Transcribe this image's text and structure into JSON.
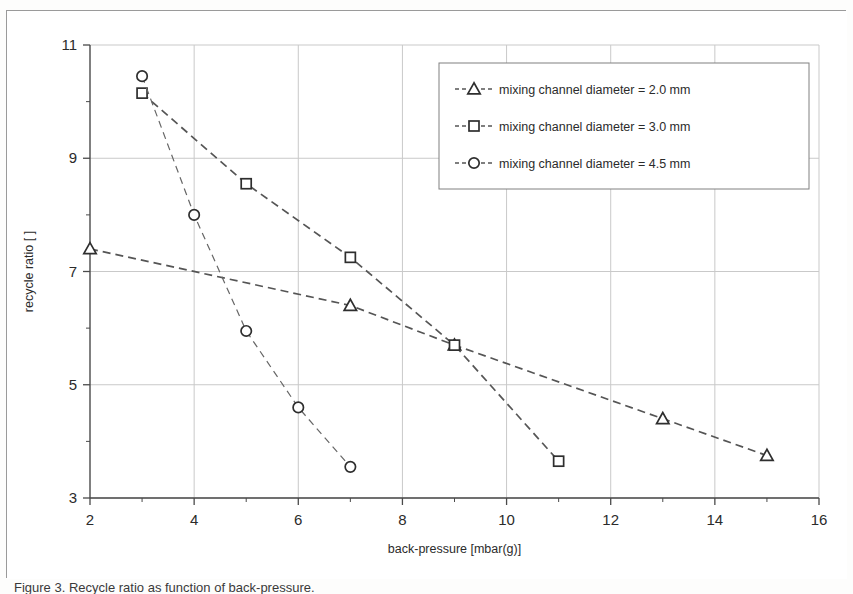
{
  "figure": {
    "caption": "Figure 3. Recycle ratio as function of back-pressure."
  },
  "chart_data": {
    "type": "line",
    "title": "",
    "xlabel": "back-pressure [mbar(g)]",
    "ylabel": "recycle ratio [ ]",
    "xlim": [
      2,
      16
    ],
    "ylim": [
      3,
      11
    ],
    "xticks": [
      2,
      4,
      6,
      8,
      10,
      12,
      14,
      16
    ],
    "yticks": [
      3,
      5,
      7,
      9,
      11
    ],
    "xtick_labels": [
      "2",
      "4",
      "6",
      "8",
      "10",
      "12",
      "14",
      "16"
    ],
    "ytick_labels": [
      "3",
      "5",
      "7",
      "9",
      "11"
    ],
    "x_minor_step": 1,
    "y_minor_step": 1,
    "grid": true,
    "legend_position": "top-right",
    "series": [
      {
        "name": "mixing channel diameter = 2.0 mm",
        "marker": "triangle",
        "x": [
          2,
          7,
          9,
          13,
          15
        ],
        "y": [
          7.4,
          6.4,
          5.7,
          4.4,
          3.75
        ]
      },
      {
        "name": "mixing channel diameter = 3.0 mm",
        "marker": "square",
        "x": [
          3,
          5,
          7,
          9,
          11
        ],
        "y": [
          10.15,
          8.55,
          7.25,
          5.7,
          3.65
        ]
      },
      {
        "name": "mixing channel diameter = 4.5 mm",
        "marker": "circle",
        "x": [
          3,
          4,
          5,
          6,
          7
        ],
        "y": [
          10.45,
          8.0,
          5.95,
          4.6,
          3.55
        ]
      }
    ],
    "colors": {
      "line": "#555555",
      "marker_stroke": "#2e2e2e",
      "marker_fill": "#ffffff",
      "grid": "#c9c9c9",
      "axis": "#4a4a4a",
      "background": "#ffffff"
    }
  }
}
